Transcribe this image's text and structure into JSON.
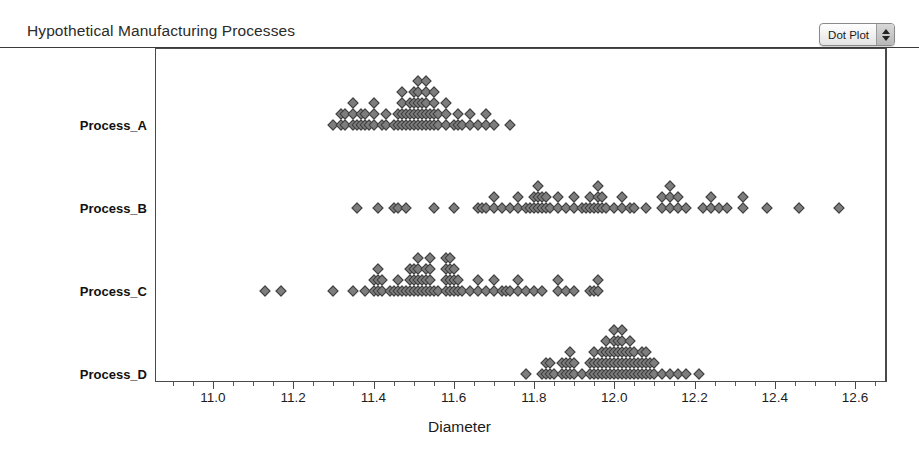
{
  "header": {
    "title": "Hypothetical Manufacturing Processes"
  },
  "plot_type_selector": {
    "value": "Dot Plot",
    "up_arrow": "arrow-up-icon",
    "down_arrow": "arrow-down-icon"
  },
  "axis": {
    "x_title": "Diameter",
    "x_ticks": [
      "11.0",
      "11.2",
      "11.4",
      "11.6",
      "11.8",
      "12.0",
      "12.2",
      "12.4",
      "12.6"
    ],
    "x_min": 10.9,
    "x_max": 12.68,
    "x_tick_step": 0.2,
    "x_minor_step": 0.05,
    "categories": [
      "Process_A",
      "Process_B",
      "Process_C",
      "Process_D"
    ]
  },
  "colors": {
    "dot_fill": "#7d7d7d",
    "dot_border": "#3d3d3d",
    "axis": "#4a4a4a",
    "text": "#1c1c1c"
  },
  "chart_data": {
    "type": "scatter",
    "subtype": "dot-plot",
    "title": "Hypothetical Manufacturing Processes",
    "xlabel": "Diameter",
    "ylabel": "",
    "xlim": [
      10.9,
      12.68
    ],
    "grid": false,
    "legend": "none",
    "categories": [
      "Process_A",
      "Process_B",
      "Process_C",
      "Process_D"
    ],
    "note": "Each series lists stacked dot columns as [x_value, count]; dots stack upward from the category baseline.",
    "series": [
      {
        "name": "Process_A",
        "baseline_y": 125,
        "stacks": [
          [
            11.3,
            1
          ],
          [
            11.32,
            2
          ],
          [
            11.33,
            2
          ],
          [
            11.35,
            3
          ],
          [
            11.36,
            1
          ],
          [
            11.37,
            2
          ],
          [
            11.38,
            2
          ],
          [
            11.39,
            1
          ],
          [
            11.4,
            3
          ],
          [
            11.42,
            1
          ],
          [
            11.43,
            2
          ],
          [
            11.45,
            1
          ],
          [
            11.46,
            2
          ],
          [
            11.47,
            4
          ],
          [
            11.48,
            2
          ],
          [
            11.49,
            3
          ],
          [
            11.5,
            4
          ],
          [
            11.51,
            5
          ],
          [
            11.52,
            3
          ],
          [
            11.53,
            5
          ],
          [
            11.54,
            2
          ],
          [
            11.55,
            4
          ],
          [
            11.56,
            2
          ],
          [
            11.58,
            3
          ],
          [
            11.6,
            1
          ],
          [
            11.61,
            2
          ],
          [
            11.62,
            1
          ],
          [
            11.64,
            2
          ],
          [
            11.66,
            1
          ],
          [
            11.68,
            2
          ],
          [
            11.7,
            1
          ],
          [
            11.74,
            1
          ]
        ]
      },
      {
        "name": "Process_B",
        "baseline_y": 208,
        "stacks": [
          [
            11.36,
            1
          ],
          [
            11.41,
            1
          ],
          [
            11.45,
            1
          ],
          [
            11.46,
            1
          ],
          [
            11.48,
            1
          ],
          [
            11.55,
            1
          ],
          [
            11.6,
            1
          ],
          [
            11.66,
            1
          ],
          [
            11.67,
            1
          ],
          [
            11.68,
            1
          ],
          [
            11.7,
            2
          ],
          [
            11.72,
            1
          ],
          [
            11.74,
            1
          ],
          [
            11.76,
            2
          ],
          [
            11.78,
            1
          ],
          [
            11.79,
            1
          ],
          [
            11.8,
            2
          ],
          [
            11.81,
            3
          ],
          [
            11.82,
            2
          ],
          [
            11.83,
            2
          ],
          [
            11.84,
            1
          ],
          [
            11.86,
            2
          ],
          [
            11.88,
            1
          ],
          [
            11.9,
            2
          ],
          [
            11.92,
            1
          ],
          [
            11.93,
            1
          ],
          [
            11.94,
            2
          ],
          [
            11.95,
            1
          ],
          [
            11.96,
            3
          ],
          [
            11.97,
            2
          ],
          [
            11.98,
            1
          ],
          [
            12.0,
            1
          ],
          [
            12.02,
            2
          ],
          [
            12.04,
            1
          ],
          [
            12.05,
            1
          ],
          [
            12.08,
            1
          ],
          [
            12.12,
            2
          ],
          [
            12.14,
            3
          ],
          [
            12.16,
            2
          ],
          [
            12.18,
            1
          ],
          [
            12.22,
            1
          ],
          [
            12.24,
            2
          ],
          [
            12.26,
            1
          ],
          [
            12.28,
            1
          ],
          [
            12.32,
            2
          ],
          [
            12.38,
            1
          ],
          [
            12.46,
            1
          ],
          [
            12.56,
            1
          ]
        ]
      },
      {
        "name": "Process_C",
        "baseline_y": 291,
        "stacks": [
          [
            11.13,
            1
          ],
          [
            11.17,
            1
          ],
          [
            11.3,
            1
          ],
          [
            11.35,
            1
          ],
          [
            11.38,
            1
          ],
          [
            11.4,
            2
          ],
          [
            11.41,
            3
          ],
          [
            11.42,
            2
          ],
          [
            11.44,
            1
          ],
          [
            11.45,
            1
          ],
          [
            11.46,
            2
          ],
          [
            11.47,
            1
          ],
          [
            11.48,
            1
          ],
          [
            11.49,
            3
          ],
          [
            11.5,
            3
          ],
          [
            11.51,
            4
          ],
          [
            11.52,
            2
          ],
          [
            11.53,
            3
          ],
          [
            11.54,
            4
          ],
          [
            11.55,
            1
          ],
          [
            11.56,
            1
          ],
          [
            11.58,
            4
          ],
          [
            11.59,
            4
          ],
          [
            11.6,
            3
          ],
          [
            11.61,
            2
          ],
          [
            11.62,
            1
          ],
          [
            11.64,
            1
          ],
          [
            11.66,
            2
          ],
          [
            11.68,
            1
          ],
          [
            11.7,
            2
          ],
          [
            11.72,
            1
          ],
          [
            11.73,
            1
          ],
          [
            11.74,
            1
          ],
          [
            11.76,
            2
          ],
          [
            11.78,
            1
          ],
          [
            11.8,
            1
          ],
          [
            11.82,
            1
          ],
          [
            11.86,
            2
          ],
          [
            11.88,
            1
          ],
          [
            11.9,
            1
          ],
          [
            11.94,
            1
          ],
          [
            11.95,
            1
          ],
          [
            11.96,
            2
          ]
        ]
      },
      {
        "name": "Process_D",
        "baseline_y": 374,
        "stacks": [
          [
            11.78,
            1
          ],
          [
            11.82,
            1
          ],
          [
            11.83,
            2
          ],
          [
            11.84,
            2
          ],
          [
            11.85,
            1
          ],
          [
            11.87,
            2
          ],
          [
            11.88,
            2
          ],
          [
            11.89,
            3
          ],
          [
            11.9,
            2
          ],
          [
            11.92,
            1
          ],
          [
            11.94,
            2
          ],
          [
            11.95,
            3
          ],
          [
            11.96,
            2
          ],
          [
            11.97,
            3
          ],
          [
            11.98,
            4
          ],
          [
            11.99,
            3
          ],
          [
            12.0,
            5
          ],
          [
            12.01,
            4
          ],
          [
            12.02,
            5
          ],
          [
            12.03,
            3
          ],
          [
            12.04,
            4
          ],
          [
            12.05,
            3
          ],
          [
            12.06,
            2
          ],
          [
            12.07,
            3
          ],
          [
            12.08,
            3
          ],
          [
            12.09,
            2
          ],
          [
            12.1,
            2
          ],
          [
            12.12,
            1
          ],
          [
            12.14,
            1
          ],
          [
            12.16,
            1
          ],
          [
            12.18,
            1
          ],
          [
            12.21,
            1
          ]
        ]
      }
    ]
  }
}
